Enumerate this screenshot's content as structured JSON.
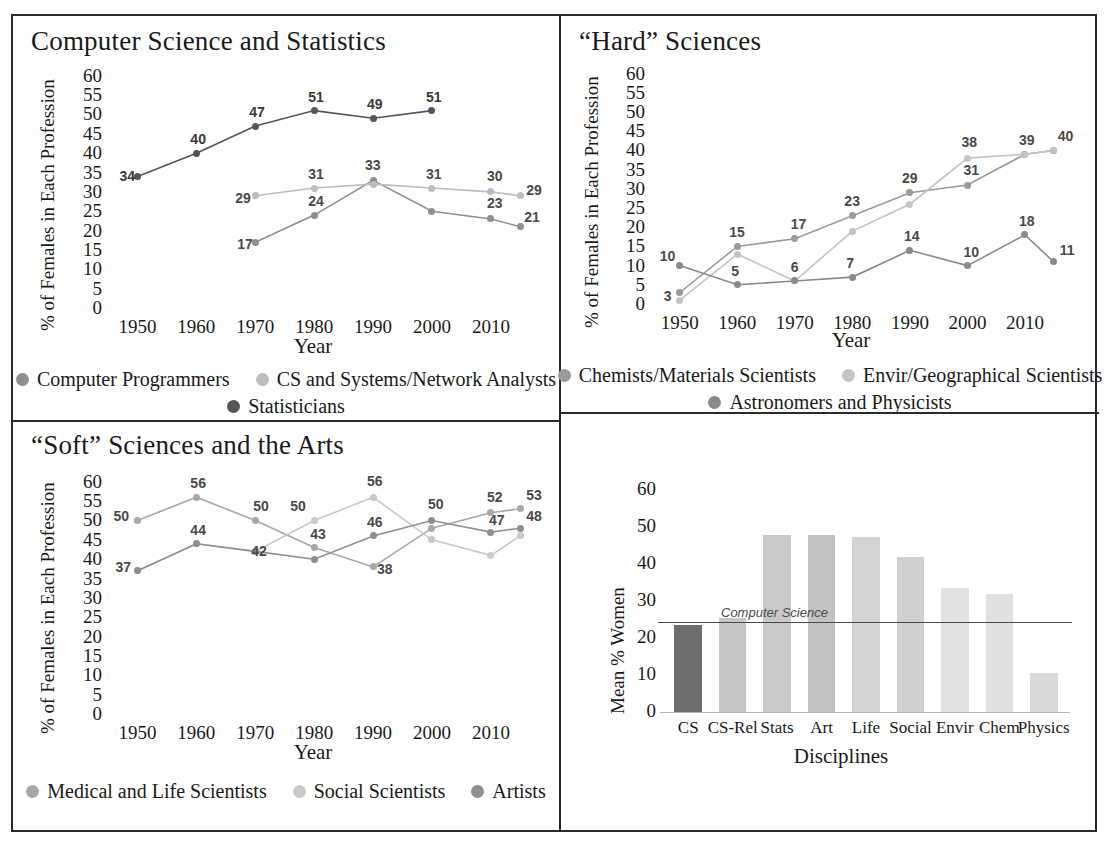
{
  "figure": {
    "panels": [
      "cs-stats",
      "hard-sciences",
      "soft-sciences",
      "mean-bar"
    ]
  },
  "chart_data": [
    {
      "id": "cs-stats",
      "type": "line",
      "title": "Computer Science and Statistics",
      "xlabel": "Year",
      "ylabel": "% of Females in Each Profession",
      "x": [
        1950,
        1960,
        1970,
        1980,
        1990,
        2000,
        2010,
        2015
      ],
      "xticks": [
        "1950",
        "1960",
        "1970",
        "1980",
        "1990",
        "2000",
        "2010"
      ],
      "yticks": [
        "60",
        "55",
        "50",
        "45",
        "40",
        "35",
        "30",
        "25",
        "20",
        "15",
        "10",
        "5",
        "0"
      ],
      "ylim": [
        0,
        62
      ],
      "xlim": [
        1945,
        2018
      ],
      "grid": false,
      "legend_position": "below",
      "series": [
        {
          "name": "Computer Programmers",
          "color": "#8f8f8f",
          "x": [
            1970,
            1980,
            1990,
            2000,
            2010,
            2015
          ],
          "values": [
            17,
            24,
            33,
            25,
            23,
            21
          ],
          "labels": [
            "17",
            "24",
            "33",
            "",
            "23",
            "21"
          ]
        },
        {
          "name": "CS and Systems/Network Analysts",
          "color": "#bdbdbd",
          "x": [
            1970,
            1980,
            1990,
            2000,
            2010,
            2015
          ],
          "values": [
            29,
            31,
            32,
            31,
            30,
            29
          ],
          "labels": [
            "29",
            "31",
            "",
            "31",
            "30",
            "29"
          ]
        },
        {
          "name": "Statisticians",
          "color": "#555555",
          "x": [
            1950,
            1960,
            1970,
            1980,
            1990,
            2000
          ],
          "values": [
            34,
            40,
            47,
            51,
            49,
            51
          ],
          "labels": [
            "34",
            "40",
            "47",
            "51",
            "49",
            "51"
          ]
        }
      ]
    },
    {
      "id": "hard-sciences",
      "type": "line",
      "title": "“Hard” Sciences",
      "xlabel": "Year",
      "ylabel": "% of Females in Each Profession",
      "x": [
        1950,
        1960,
        1970,
        1980,
        1990,
        2000,
        2010,
        2015
      ],
      "xticks": [
        "1950",
        "1960",
        "1970",
        "1980",
        "1990",
        "2000",
        "2010"
      ],
      "yticks": [
        "60",
        "55",
        "50",
        "45",
        "40",
        "35",
        "30",
        "25",
        "20",
        "15",
        "10",
        "5",
        "0"
      ],
      "ylim": [
        0,
        62
      ],
      "xlim": [
        1945,
        2018
      ],
      "grid": false,
      "legend_position": "below",
      "series": [
        {
          "name": "Chemists/Materials Scientists",
          "color": "#9a9a9a",
          "x": [
            1950,
            1960,
            1970,
            1980,
            1990,
            2000,
            2010,
            2015
          ],
          "values": [
            3,
            15,
            17,
            23,
            29,
            31,
            39,
            40
          ],
          "labels": [
            "3",
            "15",
            "17",
            "23",
            "29",
            "31",
            "39",
            "40"
          ]
        },
        {
          "name": "Envir/Geographical Scientists",
          "color": "#c4c4c4",
          "x": [
            1950,
            1960,
            1970,
            1980,
            1990,
            2000,
            2010,
            2015
          ],
          "values": [
            1,
            13,
            6,
            19,
            26,
            38,
            39,
            40
          ],
          "labels": [
            "",
            "",
            "",
            "",
            "",
            "38",
            "",
            ""
          ]
        },
        {
          "name": "Astronomers and Physicists",
          "color": "#8a8a8a",
          "x": [
            1950,
            1960,
            1970,
            1980,
            1990,
            2000,
            2010,
            2015
          ],
          "values": [
            10,
            5,
            6,
            7,
            14,
            10,
            18,
            11
          ],
          "labels": [
            "10",
            "5",
            "6",
            "7",
            "14",
            "10",
            "18",
            "11"
          ]
        }
      ]
    },
    {
      "id": "soft-sciences",
      "type": "line",
      "title": "“Soft” Sciences and the Arts",
      "xlabel": "Year",
      "ylabel": "% of Females in Each Profession",
      "x": [
        1950,
        1960,
        1970,
        1980,
        1990,
        2000,
        2010,
        2015
      ],
      "xticks": [
        "1950",
        "1960",
        "1970",
        "1980",
        "1990",
        "2000",
        "2010"
      ],
      "yticks": [
        "60",
        "55",
        "50",
        "45",
        "40",
        "35",
        "30",
        "25",
        "20",
        "15",
        "10",
        "5",
        "0"
      ],
      "ylim": [
        0,
        62
      ],
      "xlim": [
        1945,
        2018
      ],
      "grid": false,
      "legend_position": "below",
      "series": [
        {
          "name": "Medical and Life Scientists",
          "color": "#a8a8a8",
          "x": [
            1950,
            1960,
            1970,
            1980,
            1990,
            2000,
            2010,
            2015
          ],
          "values": [
            50,
            56,
            50,
            43,
            38,
            48,
            52,
            53
          ],
          "labels": [
            "50",
            "56",
            "50",
            "43",
            "38",
            "",
            "52",
            "53"
          ]
        },
        {
          "name": "Social Scientists",
          "color": "#c9c9c9",
          "x": [
            1950,
            1960,
            1970,
            1980,
            1990,
            2000,
            2010,
            2015
          ],
          "values": [
            37,
            44,
            42,
            50,
            56,
            45,
            41,
            46
          ],
          "labels": [
            "",
            "",
            "",
            "50",
            "56",
            "",
            "",
            ""
          ]
        },
        {
          "name": "Artists",
          "color": "#8f8f8f",
          "x": [
            1950,
            1960,
            1970,
            1980,
            1990,
            2000,
            2010,
            2015
          ],
          "values": [
            37,
            44,
            42,
            40,
            46,
            50,
            47,
            48
          ],
          "labels": [
            "37",
            "44",
            "42",
            "",
            "46",
            "50",
            "47",
            "48"
          ]
        }
      ]
    },
    {
      "id": "mean-bar",
      "type": "bar",
      "title": "",
      "xlabel": "Disciplines",
      "ylabel": "Mean % Women",
      "categories": [
        "CS",
        "CS-Rel",
        "Stats",
        "Art",
        "Life",
        "Social",
        "Envir",
        "Chem",
        "Physics"
      ],
      "values": [
        23.5,
        25.5,
        48,
        48,
        47.5,
        42,
        33.5,
        32,
        10.5
      ],
      "colors": [
        "#6e6e6e",
        "#c6c6c6",
        "#c9c9c9",
        "#c2c2c2",
        "#d3d3d3",
        "#cfcfcf",
        "#e2e2e2",
        "#e0e0e0",
        "#d9d9d9"
      ],
      "yticks": [
        "60",
        "50",
        "40",
        "30",
        "20",
        "10",
        "0"
      ],
      "ylim": [
        0,
        65
      ],
      "grid": false,
      "reference_line": {
        "label": "Computer Science",
        "value": 24.5,
        "color": "#4a4a4a"
      }
    }
  ]
}
